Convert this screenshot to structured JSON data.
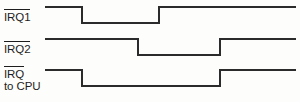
{
  "figure": {
    "width": 300,
    "height": 102,
    "background_color": "#fdfdfb",
    "line_color": "#2b2b2b",
    "text_color": "#1d1d1d"
  },
  "signals": [
    {
      "id": "irq1",
      "label": "IRQ1",
      "label_overline": true,
      "label_line2": "",
      "active_low": true,
      "high_y": 7,
      "low_y": 23,
      "start_x": 45,
      "end_x": 296,
      "initial_level": "high",
      "transitions": [
        {
          "x": 82,
          "edge": "falling"
        },
        {
          "x": 159,
          "edge": "rising"
        }
      ]
    },
    {
      "id": "irq2",
      "label": "IRQ2",
      "label_overline": true,
      "label_line2": "",
      "active_low": true,
      "high_y": 39,
      "low_y": 55,
      "start_x": 45,
      "end_x": 296,
      "initial_level": "high",
      "transitions": [
        {
          "x": 138,
          "edge": "falling"
        },
        {
          "x": 220,
          "edge": "rising"
        }
      ]
    },
    {
      "id": "irq-to-cpu",
      "label": "IRQ",
      "label_overline": true,
      "label_line2": "to CPU",
      "active_low": true,
      "high_y": 70,
      "low_y": 86,
      "start_x": 45,
      "end_x": 296,
      "initial_level": "high",
      "transitions": [
        {
          "x": 82,
          "edge": "falling"
        },
        {
          "x": 220,
          "edge": "rising"
        }
      ]
    }
  ],
  "paths": {
    "irq1": "M45,7 L82,7 L82,23 L159,23 L159,7 L296,7",
    "irq2": "M45,39 L138,39 L138,55 L220,55 L220,39 L296,39",
    "irq_to_cpu": "M45,70 L82,70 L82,86 L220,86 L220,70 L296,70"
  }
}
